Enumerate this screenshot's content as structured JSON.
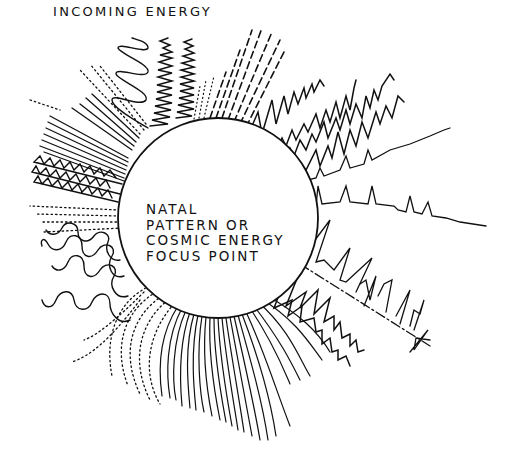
{
  "diagram": {
    "title": "INCOMING ENERGY",
    "center_label": {
      "lines": [
        "NATAL",
        "PATTERN OR",
        "COSMIC ENERGY",
        "FOCUS POINT"
      ]
    },
    "center": {
      "x": 218,
      "y": 218,
      "radius": 100
    },
    "colors": {
      "ink": "#111111",
      "background": "#ffffff"
    },
    "wave_bands": [
      {
        "name": "dashed-lines-top",
        "style": "dashed"
      },
      {
        "name": "large-loops-top",
        "style": "loops"
      },
      {
        "name": "dense-zigzag-top",
        "style": "dense-zigzag"
      },
      {
        "name": "sawtooth-upper-right",
        "style": "sawtooth"
      },
      {
        "name": "spike-train-right",
        "style": "spikes"
      },
      {
        "name": "spike-train-lower-right",
        "style": "spikes-dashed"
      },
      {
        "name": "zigzag-lower-right",
        "style": "zigzag"
      },
      {
        "name": "fan-lines-bottom",
        "style": "curved-lines"
      },
      {
        "name": "dotted-lines-bottom-left",
        "style": "dotted"
      },
      {
        "name": "squiggle-loops-left",
        "style": "loops"
      },
      {
        "name": "zigzag-left",
        "style": "zigzag"
      },
      {
        "name": "parallel-lines-left",
        "style": "lines"
      },
      {
        "name": "dotted-lines-upper-left",
        "style": "dotted"
      }
    ]
  }
}
